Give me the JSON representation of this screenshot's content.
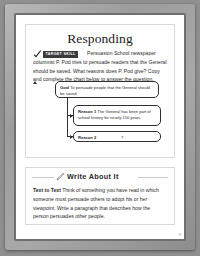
{
  "document": {
    "page_number": "9"
  },
  "responding": {
    "title": "Responding",
    "badge_label": "TARGET SKILL",
    "check_icon": "checkmark-icon",
    "intro_text": "Persuasion School newspaper columnist P. Pod tries to persuade readers that the General should be saved. What reasons does P. Pod give? Copy and complete the chart below to answer the question.",
    "chart": {
      "goal": {
        "label": "Goal",
        "text": "To persuade people that the General should be saved"
      },
      "reason1": {
        "label": "Reason 1",
        "text": "The General has been part of school history for nearly 150 years."
      },
      "reason2": {
        "label": "Reason 2",
        "text": "?"
      }
    }
  },
  "write_about_it": {
    "title": "Write About It",
    "pencil_icon": "pencil-icon",
    "prompt_label": "Text to Text",
    "prompt_text": "Think of something you have read in which someone must persuade others to adopt his or her viewpoint. Write a paragraph that describes how the person persuades other people."
  }
}
